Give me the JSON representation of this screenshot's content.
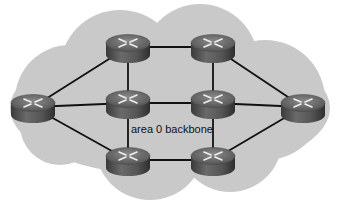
{
  "diagram": {
    "label": "area 0 backbone",
    "colors": {
      "cloud": "#c9c9c9",
      "link": "#111111",
      "router_top": "#6e6e6e",
      "router_body": "#4a4a4a",
      "router_arrows": "#e6e6e6"
    },
    "nodes": [
      {
        "id": "TL",
        "name": "router-top-left",
        "x": 128,
        "y": 47
      },
      {
        "id": "TR",
        "name": "router-top-right",
        "x": 213,
        "y": 47
      },
      {
        "id": "L",
        "name": "router-left",
        "x": 33,
        "y": 107
      },
      {
        "id": "ML",
        "name": "router-mid-left",
        "x": 128,
        "y": 103
      },
      {
        "id": "MR",
        "name": "router-mid-right",
        "x": 213,
        "y": 103
      },
      {
        "id": "R",
        "name": "router-right",
        "x": 303,
        "y": 107
      },
      {
        "id": "BL",
        "name": "router-bottom-left",
        "x": 128,
        "y": 160
      },
      {
        "id": "BR",
        "name": "router-bottom-right",
        "x": 213,
        "y": 160
      }
    ],
    "links": [
      [
        "TL",
        "TR"
      ],
      [
        "TL",
        "L"
      ],
      [
        "TL",
        "ML"
      ],
      [
        "TR",
        "MR"
      ],
      [
        "TR",
        "R"
      ],
      [
        "L",
        "ML"
      ],
      [
        "ML",
        "MR"
      ],
      [
        "MR",
        "R"
      ],
      [
        "L",
        "BL"
      ],
      [
        "ML",
        "BL"
      ],
      [
        "MR",
        "BR"
      ],
      [
        "BL",
        "BR"
      ],
      [
        "BR",
        "R"
      ]
    ]
  }
}
